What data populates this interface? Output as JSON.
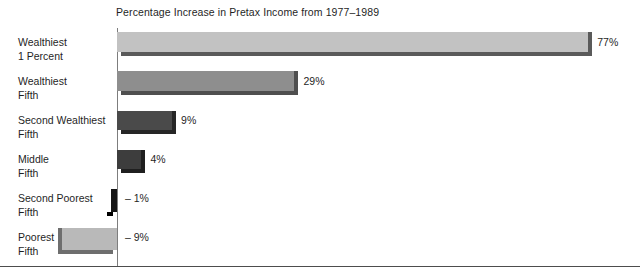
{
  "chart_data": {
    "type": "bar",
    "orientation": "horizontal",
    "title": "Percentage Increase in Pretax Income from 1977–1989",
    "xlabel": "",
    "ylabel": "",
    "grid": false,
    "legend": null,
    "xlim": [
      -9,
      77
    ],
    "zero_axis": true,
    "categories": [
      "Wealthiest 1 Percent",
      "Wealthiest Fifth",
      "Second Wealthiest Fifth",
      "Middle Fifth",
      "Second Poorest Fifth",
      "Poorest Fifth"
    ],
    "values": [
      77,
      29,
      9,
      4,
      -1,
      -9
    ],
    "data_labels": [
      "77%",
      "29%",
      "9%",
      "4%",
      "– 1%",
      "– 9%"
    ],
    "bars": [
      {
        "category_line1": "Wealthiest",
        "category_line2": "1 Percent",
        "value": 77,
        "label": "77%",
        "color": "#c2c2c2",
        "shadow_color": "#5a5a5a"
      },
      {
        "category_line1": "Wealthiest",
        "category_line2": "Fifth",
        "value": 29,
        "label": "29%",
        "color": "#8e8e8e",
        "shadow_color": "#4f4f4f"
      },
      {
        "category_line1": "Second Wealthiest",
        "category_line2": "Fifth",
        "value": 9,
        "label": "9%",
        "color": "#4a4a4a",
        "shadow_color": "#262626"
      },
      {
        "category_line1": "Middle",
        "category_line2": "Fifth",
        "value": 4,
        "label": "4%",
        "color": "#3d3d3d",
        "shadow_color": "#1f1f1f"
      },
      {
        "category_line1": "Second Poorest",
        "category_line2": "Fifth",
        "value": -1,
        "label": "– 1%",
        "color": "#141414",
        "shadow_color": "#000000"
      },
      {
        "category_line1": "Poorest",
        "category_line2": "Fifth",
        "value": -9,
        "label": "– 9%",
        "color": "#b9b9b9",
        "shadow_color": "#6e6e6e"
      }
    ],
    "colors": {
      "axis": "#7d7d7d",
      "baseline": "#4d4d4d",
      "text": "#1f1f1f",
      "background": "#ffffff"
    }
  }
}
